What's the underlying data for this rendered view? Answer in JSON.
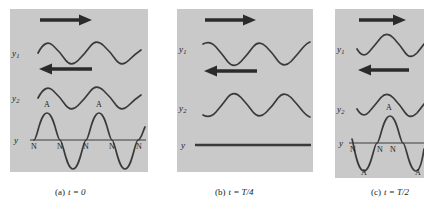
{
  "figure": {
    "panel_bg_color": "#c9c9c9",
    "curve_color": "#3a3a3a",
    "arrow_color": "#2b2b2b",
    "text_color": "#1c1c1c"
  },
  "panels": [
    {
      "id": "panel-a",
      "caption_letter": "(a)",
      "caption_expr": "t = 0",
      "rows": [
        {
          "label": "y",
          "sub": "1",
          "direction_icon": "arrow-right-icon",
          "direction": "right"
        },
        {
          "label": "y",
          "sub": "2",
          "direction_icon": "arrow-left-icon",
          "direction": "left"
        },
        {
          "label": "y",
          "sub": "",
          "direction_icon": "",
          "direction": ""
        }
      ],
      "resultant": "constructive",
      "antinode_labels": [
        "A",
        "A"
      ],
      "node_labels": [
        "N",
        "N",
        "N",
        "N",
        "N"
      ],
      "antinode_labels_below": []
    },
    {
      "id": "panel-b",
      "caption_letter": "(b)",
      "caption_expr": "t = T/4",
      "rows": [
        {
          "label": "y",
          "sub": "1",
          "direction_icon": "arrow-right-icon",
          "direction": "right"
        },
        {
          "label": "y",
          "sub": "2",
          "direction_icon": "arrow-left-icon",
          "direction": "left"
        },
        {
          "label": "y",
          "sub": "",
          "direction_icon": "",
          "direction": ""
        }
      ],
      "resultant": "destructive",
      "antinode_labels": [],
      "node_labels": [],
      "antinode_labels_below": []
    },
    {
      "id": "panel-c",
      "caption_letter": "(c)",
      "caption_expr": "t = T/2",
      "rows": [
        {
          "label": "y",
          "sub": "1",
          "direction_icon": "arrow-right-icon",
          "direction": "right"
        },
        {
          "label": "y",
          "sub": "2",
          "direction_icon": "arrow-left-icon",
          "direction": "left"
        },
        {
          "label": "y",
          "sub": "",
          "direction_icon": "",
          "direction": ""
        }
      ],
      "resultant": "constructive-inverted",
      "antinode_labels": [
        "A"
      ],
      "node_labels": [
        "N",
        "N",
        "N"
      ],
      "antinode_labels_below": [
        "A",
        "A"
      ]
    }
  ]
}
